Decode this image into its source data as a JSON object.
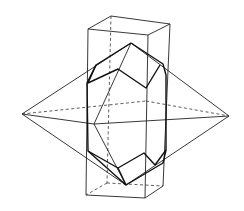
{
  "figure": {
    "colors": {
      "line": "#222222",
      "background": "#ffffff"
    }
  },
  "geometry": {
    "prism": {
      "front": [
        [
          88,
          29
        ],
        [
          148,
          35
        ],
        [
          145,
          198
        ],
        [
          86,
          195
        ]
      ],
      "back_top": [
        [
          111,
          16
        ],
        [
          170,
          24
        ]
      ],
      "back_bottom": [
        [
          107,
          183
        ],
        [
          163,
          186
        ]
      ]
    },
    "bipyramid": {
      "left_apex": [
        22,
        114
      ],
      "right_apex": [
        229,
        116
      ],
      "top_point": [
        131,
        43
      ],
      "bottom_point": [
        126,
        185
      ],
      "back_mid": [
        146,
        101
      ],
      "front_mid": [
        94,
        124
      ]
    },
    "crystal": {
      "apex_top": [
        131,
        43
      ],
      "apex_bottom": [
        126,
        185
      ]
    }
  }
}
